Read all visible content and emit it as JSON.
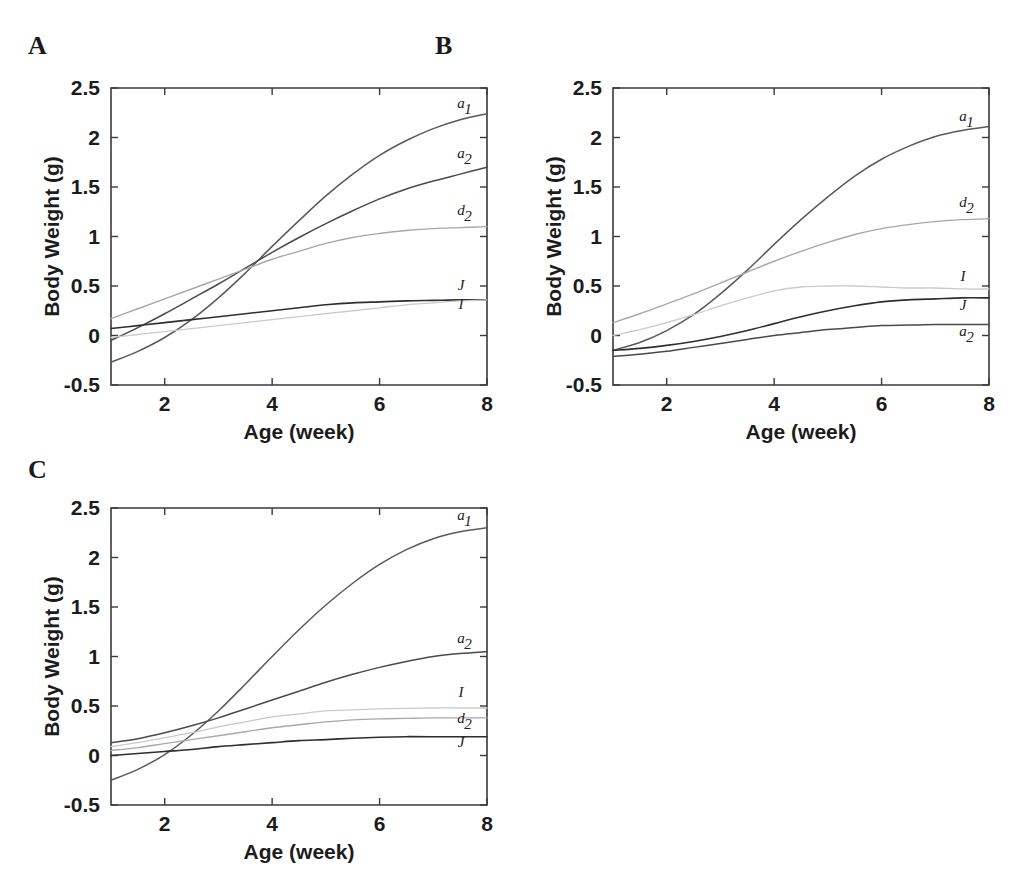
{
  "figure": {
    "panels": [
      {
        "letter": "A",
        "letter_x": 28,
        "letter_y": 33,
        "origin_x": 0,
        "origin_y": 60,
        "chart_data": {
          "type": "line",
          "title": "",
          "xlabel": "Age (week)",
          "ylabel": "Body Weight (g)",
          "xlim": [
            1,
            8
          ],
          "ylim": [
            -0.5,
            2.5
          ],
          "xticks": [
            2,
            4,
            6,
            8
          ],
          "xtick_labels": [
            "2",
            "4",
            "6",
            "8"
          ],
          "yticks": [
            -0.5,
            0,
            0.5,
            1,
            1.5,
            2,
            2.5
          ],
          "ytick_labels": [
            "-0.5",
            "0",
            "0.5",
            "1",
            "1.5",
            "2",
            "2.5"
          ],
          "grid": false,
          "legend": "inline-right",
          "x": [
            1,
            1.5,
            2,
            2.5,
            3,
            3.5,
            4,
            4.5,
            5,
            5.5,
            6,
            6.5,
            7,
            7.5,
            8
          ],
          "series": [
            {
              "name": "a_1",
              "label": "a",
              "sublabel": "1",
              "color": "#5a5a5a",
              "width": 1.5,
              "label_y": 2.3,
              "values": [
                -0.27,
                -0.16,
                -0.02,
                0.16,
                0.38,
                0.63,
                0.9,
                1.16,
                1.41,
                1.63,
                1.82,
                1.97,
                2.09,
                2.18,
                2.24
              ]
            },
            {
              "name": "a_2",
              "label": "a",
              "sublabel": "2",
              "color": "#4a4a4a",
              "width": 1.5,
              "label_y": 1.79,
              "values": [
                -0.05,
                0.08,
                0.22,
                0.37,
                0.52,
                0.68,
                0.84,
                0.99,
                1.13,
                1.26,
                1.38,
                1.48,
                1.56,
                1.63,
                1.7
              ]
            },
            {
              "name": "d_2",
              "label": "d",
              "sublabel": "2",
              "color": "#a8a8a8",
              "width": 1.4,
              "label_y": 1.22,
              "values": [
                0.17,
                0.27,
                0.37,
                0.47,
                0.57,
                0.67,
                0.77,
                0.85,
                0.93,
                0.99,
                1.03,
                1.06,
                1.08,
                1.09,
                1.1
              ]
            },
            {
              "name": "J",
              "label": "J",
              "sublabel": "",
              "color": "#2f2f2f",
              "width": 1.6,
              "label_y": 0.46,
              "values": [
                0.07,
                0.1,
                0.13,
                0.16,
                0.19,
                0.22,
                0.25,
                0.28,
                0.31,
                0.33,
                0.34,
                0.35,
                0.355,
                0.36,
                0.36
              ]
            },
            {
              "name": "I",
              "label": "I",
              "sublabel": "",
              "color": "#cacaca",
              "width": 1.3,
              "label_y": 0.27,
              "values": [
                -0.02,
                0.01,
                0.04,
                0.07,
                0.1,
                0.13,
                0.16,
                0.19,
                0.22,
                0.25,
                0.28,
                0.31,
                0.33,
                0.35,
                0.36
              ]
            }
          ]
        }
      },
      {
        "letter": "B",
        "letter_x": 435,
        "letter_y": 33,
        "origin_x": 502,
        "origin_y": 60,
        "chart_data": {
          "type": "line",
          "title": "",
          "xlabel": "Age (week)",
          "ylabel": "Body Weight (g)",
          "xlim": [
            1,
            8
          ],
          "ylim": [
            -0.5,
            2.5
          ],
          "xticks": [
            2,
            4,
            6,
            8
          ],
          "xtick_labels": [
            "2",
            "4",
            "6",
            "8"
          ],
          "yticks": [
            -0.5,
            0,
            0.5,
            1,
            1.5,
            2,
            2.5
          ],
          "ytick_labels": [
            "-0.5",
            "0",
            "0.5",
            "1",
            "1.5",
            "2",
            "2.5"
          ],
          "grid": false,
          "legend": "inline-right",
          "x": [
            1,
            1.5,
            2,
            2.5,
            3,
            3.5,
            4,
            4.5,
            5,
            5.5,
            6,
            6.5,
            7,
            7.5,
            8
          ],
          "series": [
            {
              "name": "a_1",
              "label": "a",
              "sublabel": "1",
              "color": "#5a5a5a",
              "width": 1.5,
              "label_y": 2.17,
              "values": [
                -0.15,
                -0.07,
                0.05,
                0.21,
                0.42,
                0.66,
                0.92,
                1.17,
                1.4,
                1.61,
                1.78,
                1.91,
                2.01,
                2.07,
                2.11
              ]
            },
            {
              "name": "d_2",
              "label": "d",
              "sublabel": "2",
              "color": "#a8a8a8",
              "width": 1.4,
              "label_y": 1.3,
              "values": [
                0.13,
                0.22,
                0.32,
                0.42,
                0.53,
                0.64,
                0.75,
                0.85,
                0.94,
                1.02,
                1.08,
                1.12,
                1.15,
                1.17,
                1.18
              ]
            },
            {
              "name": "I",
              "label": "I",
              "sublabel": "",
              "color": "#cacaca",
              "width": 1.3,
              "label_y": 0.55,
              "values": [
                0.0,
                0.06,
                0.13,
                0.21,
                0.3,
                0.38,
                0.45,
                0.49,
                0.5,
                0.5,
                0.49,
                0.48,
                0.48,
                0.47,
                0.47
              ]
            },
            {
              "name": "J",
              "label": "J",
              "sublabel": "",
              "color": "#2f2f2f",
              "width": 1.6,
              "label_y": 0.26,
              "values": [
                -0.15,
                -0.13,
                -0.1,
                -0.06,
                -0.01,
                0.05,
                0.12,
                0.19,
                0.25,
                0.3,
                0.34,
                0.36,
                0.37,
                0.38,
                0.38
              ]
            },
            {
              "name": "a_2",
              "label": "a",
              "sublabel": "2",
              "color": "#4a4a4a",
              "width": 1.5,
              "label_y": 0.0,
              "values": [
                -0.21,
                -0.19,
                -0.16,
                -0.12,
                -0.08,
                -0.04,
                0.0,
                0.03,
                0.06,
                0.08,
                0.1,
                0.105,
                0.11,
                0.11,
                0.11
              ]
            }
          ]
        }
      },
      {
        "letter": "C",
        "letter_x": 28,
        "letter_y": 457,
        "origin_x": 0,
        "origin_y": 480,
        "chart_data": {
          "type": "line",
          "title": "",
          "xlabel": "Age (week)",
          "ylabel": "Body Weight (g)",
          "xlim": [
            1,
            8
          ],
          "ylim": [
            -0.5,
            2.5
          ],
          "xticks": [
            2,
            4,
            6,
            8
          ],
          "xtick_labels": [
            "2",
            "4",
            "6",
            "8"
          ],
          "yticks": [
            -0.5,
            0,
            0.5,
            1,
            1.5,
            2,
            2.5
          ],
          "ytick_labels": [
            "-0.5",
            "0",
            "0.5",
            "1",
            "1.5",
            "2",
            "2.5"
          ],
          "grid": false,
          "legend": "inline-right",
          "x": [
            1,
            1.5,
            2,
            2.5,
            3,
            3.5,
            4,
            4.5,
            5,
            5.5,
            6,
            6.5,
            7,
            7.5,
            8
          ],
          "series": [
            {
              "name": "a_1",
              "label": "a",
              "sublabel": "1",
              "color": "#5a5a5a",
              "width": 1.5,
              "label_y": 2.38,
              "values": [
                -0.25,
                -0.14,
                0.01,
                0.21,
                0.45,
                0.72,
                1.0,
                1.27,
                1.52,
                1.74,
                1.93,
                2.08,
                2.19,
                2.26,
                2.3
              ]
            },
            {
              "name": "a_2",
              "label": "a",
              "sublabel": "2",
              "color": "#4a4a4a",
              "width": 1.5,
              "label_y": 1.14,
              "values": [
                0.13,
                0.17,
                0.23,
                0.3,
                0.38,
                0.47,
                0.56,
                0.65,
                0.74,
                0.82,
                0.89,
                0.95,
                1.0,
                1.03,
                1.05
              ]
            },
            {
              "name": "I",
              "label": "I",
              "sublabel": "",
              "color": "#cacaca",
              "width": 1.3,
              "label_y": 0.59,
              "values": [
                0.09,
                0.13,
                0.18,
                0.23,
                0.29,
                0.34,
                0.39,
                0.42,
                0.45,
                0.46,
                0.47,
                0.475,
                0.48,
                0.48,
                0.48
              ]
            },
            {
              "name": "d_2",
              "label": "d",
              "sublabel": "2",
              "color": "#a8a8a8",
              "width": 1.4,
              "label_y": 0.33,
              "values": [
                0.05,
                0.08,
                0.12,
                0.16,
                0.2,
                0.24,
                0.28,
                0.31,
                0.34,
                0.36,
                0.37,
                0.375,
                0.38,
                0.38,
                0.38
              ]
            },
            {
              "name": "J",
              "label": "J",
              "sublabel": "",
              "color": "#2f2f2f",
              "width": 1.6,
              "label_y": 0.09,
              "values": [
                0.0,
                0.02,
                0.04,
                0.06,
                0.09,
                0.11,
                0.13,
                0.15,
                0.16,
                0.175,
                0.185,
                0.19,
                0.19,
                0.19,
                0.19
              ]
            }
          ]
        }
      }
    ]
  }
}
